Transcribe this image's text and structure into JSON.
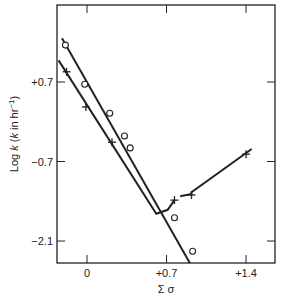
{
  "chart_data": {
    "type": "scatter",
    "title": "",
    "xlabel": "Σ σ",
    "ylabel": "Log k (k in hr⁻¹)",
    "xlim": [
      -0.27,
      1.65
    ],
    "ylim": [
      -2.4,
      2.1
    ],
    "x_ticks": [
      0,
      0.7,
      1.4
    ],
    "x_tick_labels": [
      "0",
      "+0.7",
      "+1.4"
    ],
    "y_ticks": [
      0.7,
      -0.7,
      -2.1
    ],
    "y_tick_labels": [
      "+0.7",
      "−0.7",
      "−2.1"
    ],
    "grid": false,
    "legend": null,
    "series": [
      {
        "name": "circles",
        "marker": "o",
        "points": [
          {
            "x": -0.19,
            "y": 1.35
          },
          {
            "x": -0.02,
            "y": 0.66
          },
          {
            "x": 0.2,
            "y": 0.15
          },
          {
            "x": 0.33,
            "y": -0.25
          },
          {
            "x": 0.38,
            "y": -0.46
          },
          {
            "x": 0.77,
            "y": -1.69
          },
          {
            "x": 0.93,
            "y": -2.28
          }
        ],
        "fit_line": [
          {
            "x": -0.22,
            "y": 1.47
          },
          {
            "x": 1.0,
            "y": -2.82
          }
        ]
      },
      {
        "name": "crosses",
        "marker": "+",
        "points": [
          {
            "x": -0.18,
            "y": 0.88
          },
          {
            "x": -0.01,
            "y": 0.26
          },
          {
            "x": 0.22,
            "y": -0.36
          },
          {
            "x": 0.77,
            "y": -1.38
          },
          {
            "x": 0.92,
            "y": -1.29
          },
          {
            "x": 1.4,
            "y": -0.57
          }
        ],
        "fit_line": [
          {
            "x": -0.25,
            "y": 1.08
          },
          {
            "x": 0.61,
            "y": -1.62
          },
          {
            "x": 0.71,
            "y": -1.55
          },
          {
            "x": 0.77,
            "y": -1.38
          }
        ],
        "fit_line_2": [
          {
            "x": 0.82,
            "y": -1.31
          },
          {
            "x": 0.92,
            "y": -1.27
          },
          {
            "x": 0.92,
            "y": -1.24
          },
          {
            "x": 1.45,
            "y": -0.48
          }
        ]
      }
    ]
  },
  "axes": {
    "x_title": "Σ σ",
    "y_title_main": "Log ",
    "y_title_k": "k",
    "y_title_rest1": " (",
    "y_title_k2": "k",
    "y_title_rest2": " in hr",
    "y_title_sup": "−1",
    "y_title_close": ")"
  }
}
